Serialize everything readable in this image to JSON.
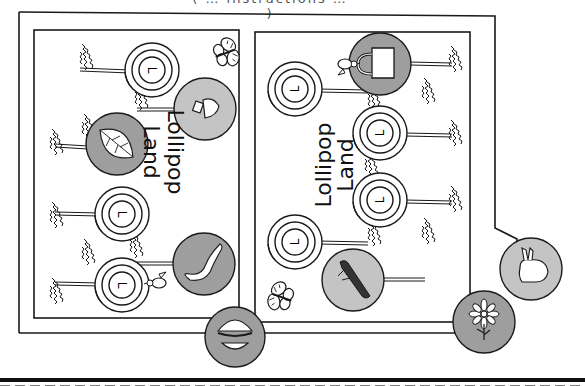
{
  "page": {
    "caption": "( … instructions … )",
    "board": {
      "panels": [
        {
          "id": "left",
          "title_line1": "Lollipop",
          "title_line2": "Land",
          "title_orientation": "rotated-90-clockwise",
          "lollipops": 4,
          "picture_spaces": [
            "bottle",
            "leaf",
            "lizard"
          ]
        },
        {
          "id": "right",
          "title_line1": "Lollipop",
          "title_line2": "Land",
          "title_orientation": "rotated-90-counterclockwise",
          "lollipops": 4,
          "picture_spaces": [
            "bucket",
            "log"
          ]
        }
      ],
      "outside_picture_spaces": [
        "hamburger",
        "flower",
        "rabbit"
      ],
      "decorations": [
        "butterfly",
        "butterfly",
        "bird",
        "bird",
        "grass-tufts"
      ],
      "lollipop_letter": "L"
    },
    "colors": {
      "line": "#1a1a1a",
      "circle_fill_dark": "#9e9e9e",
      "circle_fill_light": "#c4c4c4",
      "paper": "#ffffff"
    },
    "cut_line": "dashed"
  }
}
